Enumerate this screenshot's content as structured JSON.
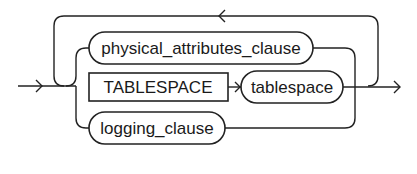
{
  "diagram": {
    "type": "railroad-syntax-diagram",
    "nodes": [
      {
        "id": "physical_attributes_clause",
        "label": "physical_attributes_clause",
        "kind": "nonterminal"
      },
      {
        "id": "tablespace_keyword",
        "label": "TABLESPACE",
        "kind": "keyword"
      },
      {
        "id": "tablespace",
        "label": "tablespace",
        "kind": "nonterminal"
      },
      {
        "id": "logging_clause",
        "label": "logging_clause",
        "kind": "nonterminal"
      }
    ],
    "structure": "loop over choice of { physical_attributes_clause | TABLESPACE tablespace | logging_clause }",
    "colors": {
      "stroke": "#222222",
      "background": "#ffffff"
    }
  }
}
